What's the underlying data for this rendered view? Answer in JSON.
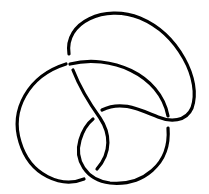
{
  "diagram": {
    "type": "knot-diagram",
    "crossings": 4,
    "stroke_color": "#000000",
    "background": "#ffffff",
    "strands": [
      {
        "name": "upper-loop",
        "d": "M 69,54 C 64,22 105,4 140,18 C 178,34 202,80 192,108 C 186,122 170,122 158,117 C 140,110 122,100 102,110"
      },
      {
        "name": "outer-arc",
        "d": "M 70,64 C 110,54 160,74 168,116"
      },
      {
        "name": "outer-arc-lower",
        "d": "M 168,128 C 171,165 142,186 110,183 C 86,180 74,160 80,140 C 83,130 88,123 93,119"
      },
      {
        "name": "left-loop",
        "d": "M 66,64 C 28,76 10,110 20,142 C 30,176 62,188 84,179"
      },
      {
        "name": "twist-strand",
        "d": "M 97,169 C 112,152 110,133 100,118 C 90,104 80,88 73,70"
      }
    ]
  }
}
